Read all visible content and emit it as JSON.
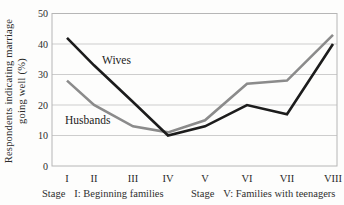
{
  "chart_data": {
    "type": "line",
    "title": "",
    "xlabel": "",
    "ylabel": "Respondents indicating marriage going well (%)",
    "ylabel_lines": [
      "Respondents indicating marriage",
      "going well (%)"
    ],
    "categories": [
      "I",
      "II",
      "III",
      "IV",
      "V",
      "VI",
      "VII",
      "VIII"
    ],
    "series": [
      {
        "name": "Wives",
        "color": "#1c1c1c",
        "values": [
          42,
          33,
          21,
          10,
          13,
          20,
          17,
          40
        ]
      },
      {
        "name": "Husbands",
        "color": "#8b8b8b",
        "values": [
          28,
          20,
          13,
          11,
          15,
          27,
          28,
          43
        ]
      }
    ],
    "ylim": [
      0,
      50
    ],
    "yticks": [
      0,
      10,
      20,
      30,
      40,
      50
    ],
    "grid": true,
    "legend": "inline-labels-on-lines",
    "layout": {
      "plot_px": {
        "left": 52,
        "right": 337,
        "top": 13.5,
        "bottom": 166
      },
      "x_positions_px": [
        67,
        94,
        133,
        168,
        205,
        247,
        287,
        333
      ],
      "grid_color": "#cdcdcd",
      "frame_color": "#b6b6b6",
      "tick_label_color": "#2b2b2b"
    }
  },
  "footnotes": {
    "left": {
      "prefix": "Stage",
      "text": "I: Beginning families"
    },
    "right": {
      "prefix": "Stage",
      "text": "V: Families with teenagers"
    }
  }
}
